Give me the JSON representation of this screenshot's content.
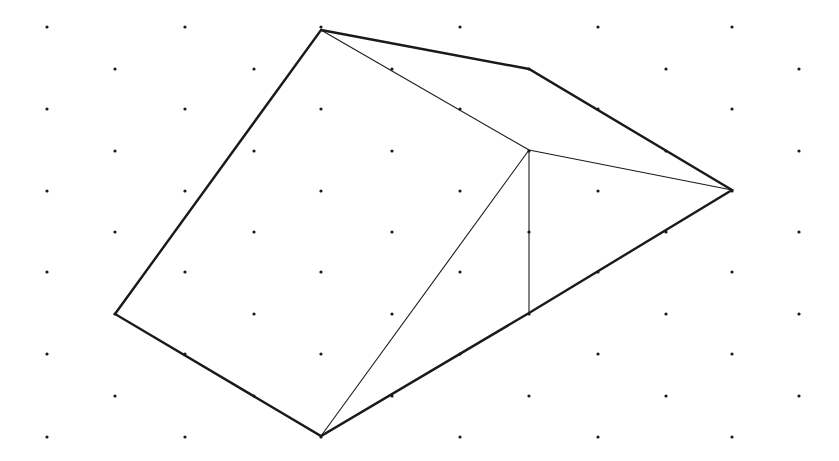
{
  "diagram": {
    "type": "isometric-dot-grid-polyhedron",
    "background": "#ffffff",
    "ink_color": "#1a1a1a",
    "grid": {
      "rows_y": [
        27,
        69,
        109,
        151,
        191,
        232,
        272,
        314,
        354,
        396,
        437
      ],
      "even_row_x": [
        47,
        185,
        321,
        460,
        598,
        732
      ],
      "odd_row_x": [
        115,
        254,
        392,
        529,
        666,
        799
      ],
      "dot_radius": 1.6
    },
    "vertices": {
      "A": [
        321,
        30
      ],
      "B": [
        529,
        69
      ],
      "C": [
        732,
        190
      ],
      "D": [
        529,
        313
      ],
      "E": [
        321,
        436
      ],
      "F": [
        115,
        314
      ],
      "G": [
        529,
        150
      ]
    },
    "outline": [
      "A",
      "B",
      "C",
      "D",
      "E",
      "F"
    ],
    "outline_width": 2.4,
    "inner_edges": [
      [
        "A",
        "G"
      ],
      [
        "G",
        "C"
      ],
      [
        "G",
        "D"
      ],
      [
        "G",
        "E"
      ]
    ],
    "inner_width": 1.1
  }
}
